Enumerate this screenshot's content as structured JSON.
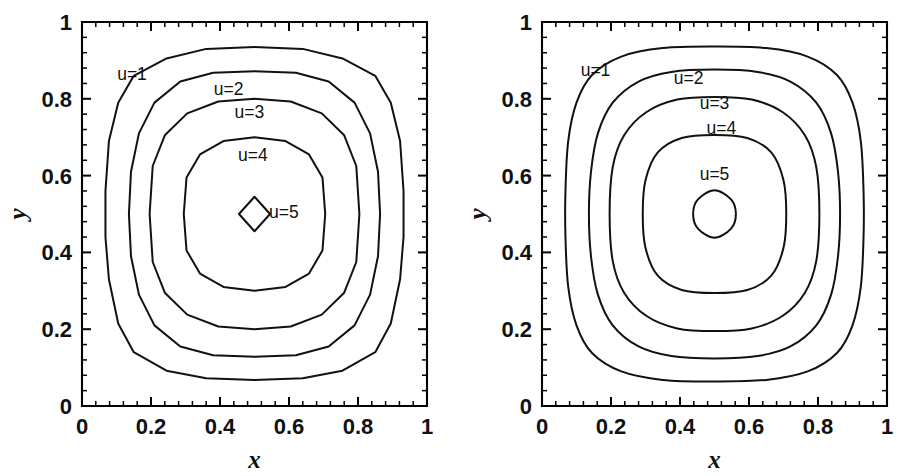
{
  "figure": {
    "background": "#ffffff",
    "line_color": "#111111",
    "panel_count": 2
  },
  "chart_data": [
    {
      "type": "line",
      "panel": "left",
      "title": "",
      "subtitle": "",
      "xlabel": "x",
      "ylabel": "y",
      "xlim": [
        0,
        1
      ],
      "ylim": [
        0,
        1
      ],
      "grid": false,
      "legend": "none",
      "xticks": [
        0,
        0.2,
        0.4,
        0.6,
        0.8,
        1
      ],
      "xticklabels": [
        "0",
        "0.2",
        "0.4",
        "0.6",
        "0.8",
        "1"
      ],
      "yticks": [
        0,
        0.2,
        0.4,
        0.6,
        0.8,
        1
      ],
      "yticklabels": [
        "0",
        "0.2",
        "0.4",
        "0.6",
        "0.8",
        "1"
      ],
      "minor_ticks_per_major": 4,
      "style": "polygonal-coarse-mesh",
      "contour_levels": [
        1,
        2,
        3,
        4,
        5
      ],
      "contour_labels": [
        "u=1",
        "u=2",
        "u=3",
        "u=4",
        "u=5"
      ],
      "label_positions": [
        {
          "label": "u=1",
          "x": 0.145,
          "y": 0.865
        },
        {
          "label": "u=2",
          "x": 0.425,
          "y": 0.825
        },
        {
          "label": "u=3",
          "x": 0.485,
          "y": 0.765
        },
        {
          "label": "u=4",
          "x": 0.495,
          "y": 0.655
        },
        {
          "label": "u=5",
          "x": 0.585,
          "y": 0.505
        }
      ],
      "center": {
        "x": 0.5,
        "y": 0.5
      },
      "contours": [
        {
          "level": 1,
          "points": [
            [
              0.5,
              0.935
            ],
            [
              0.36,
              0.93
            ],
            [
              0.245,
              0.905
            ],
            [
              0.15,
              0.86
            ],
            [
              0.105,
              0.79
            ],
            [
              0.078,
              0.69
            ],
            [
              0.068,
              0.56
            ],
            [
              0.068,
              0.44
            ],
            [
              0.078,
              0.33
            ],
            [
              0.105,
              0.215
            ],
            [
              0.15,
              0.14
            ],
            [
              0.245,
              0.092
            ],
            [
              0.36,
              0.072
            ],
            [
              0.5,
              0.068
            ],
            [
              0.64,
              0.072
            ],
            [
              0.755,
              0.092
            ],
            [
              0.85,
              0.14
            ],
            [
              0.895,
              0.215
            ],
            [
              0.922,
              0.33
            ],
            [
              0.932,
              0.44
            ],
            [
              0.932,
              0.56
            ],
            [
              0.922,
              0.69
            ],
            [
              0.895,
              0.79
            ],
            [
              0.85,
              0.86
            ],
            [
              0.755,
              0.905
            ],
            [
              0.64,
              0.93
            ]
          ]
        },
        {
          "level": 2,
          "points": [
            [
              0.5,
              0.872
            ],
            [
              0.38,
              0.868
            ],
            [
              0.285,
              0.845
            ],
            [
              0.21,
              0.79
            ],
            [
              0.165,
              0.71
            ],
            [
              0.142,
              0.61
            ],
            [
              0.136,
              0.5
            ],
            [
              0.142,
              0.39
            ],
            [
              0.165,
              0.29
            ],
            [
              0.21,
              0.21
            ],
            [
              0.285,
              0.155
            ],
            [
              0.38,
              0.132
            ],
            [
              0.5,
              0.128
            ],
            [
              0.62,
              0.132
            ],
            [
              0.715,
              0.155
            ],
            [
              0.79,
              0.21
            ],
            [
              0.835,
              0.29
            ],
            [
              0.858,
              0.39
            ],
            [
              0.864,
              0.5
            ],
            [
              0.858,
              0.61
            ],
            [
              0.835,
              0.71
            ],
            [
              0.79,
              0.79
            ],
            [
              0.715,
              0.845
            ],
            [
              0.62,
              0.868
            ]
          ]
        },
        {
          "level": 3,
          "points": [
            [
              0.5,
              0.8
            ],
            [
              0.395,
              0.793
            ],
            [
              0.305,
              0.762
            ],
            [
              0.24,
              0.705
            ],
            [
              0.205,
              0.625
            ],
            [
              0.196,
              0.5
            ],
            [
              0.205,
              0.375
            ],
            [
              0.24,
              0.295
            ],
            [
              0.305,
              0.238
            ],
            [
              0.395,
              0.207
            ],
            [
              0.5,
              0.2
            ],
            [
              0.605,
              0.207
            ],
            [
              0.695,
              0.238
            ],
            [
              0.76,
              0.295
            ],
            [
              0.795,
              0.375
            ],
            [
              0.804,
              0.5
            ],
            [
              0.795,
              0.625
            ],
            [
              0.76,
              0.705
            ],
            [
              0.695,
              0.762
            ],
            [
              0.605,
              0.793
            ]
          ]
        },
        {
          "level": 4,
          "points": [
            [
              0.5,
              0.7
            ],
            [
              0.41,
              0.69
            ],
            [
              0.342,
              0.655
            ],
            [
              0.303,
              0.595
            ],
            [
              0.295,
              0.5
            ],
            [
              0.303,
              0.405
            ],
            [
              0.342,
              0.345
            ],
            [
              0.41,
              0.31
            ],
            [
              0.5,
              0.3
            ],
            [
              0.59,
              0.31
            ],
            [
              0.658,
              0.345
            ],
            [
              0.697,
              0.405
            ],
            [
              0.705,
              0.5
            ],
            [
              0.697,
              0.595
            ],
            [
              0.658,
              0.655
            ],
            [
              0.59,
              0.69
            ]
          ]
        },
        {
          "level": 5,
          "points": [
            [
              0.5,
              0.545
            ],
            [
              0.455,
              0.5
            ],
            [
              0.5,
              0.455
            ],
            [
              0.545,
              0.5
            ]
          ]
        }
      ]
    },
    {
      "type": "line",
      "panel": "right",
      "title": "",
      "subtitle": "",
      "xlabel": "x",
      "ylabel": "y",
      "xlim": [
        0,
        1
      ],
      "ylim": [
        0,
        1
      ],
      "grid": false,
      "legend": "none",
      "xticks": [
        0,
        0.2,
        0.4,
        0.6,
        0.8,
        1
      ],
      "xticklabels": [
        "0",
        "0.2",
        "0.4",
        "0.6",
        "0.8",
        "1"
      ],
      "yticks": [
        0,
        0.2,
        0.4,
        0.6,
        0.8,
        1
      ],
      "yticklabels": [
        "0",
        "0.2",
        "0.4",
        "0.6",
        "0.8",
        "1"
      ],
      "minor_ticks_per_major": 4,
      "style": "smooth-fine-mesh",
      "contour_levels": [
        1,
        2,
        3,
        4,
        5
      ],
      "contour_labels": [
        "u=1",
        "u=2",
        "u=3",
        "u=4",
        "u=5"
      ],
      "label_positions": [
        {
          "label": "u=1",
          "x": 0.155,
          "y": 0.875
        },
        {
          "label": "u=2",
          "x": 0.425,
          "y": 0.855
        },
        {
          "label": "u=3",
          "x": 0.5,
          "y": 0.79
        },
        {
          "label": "u=4",
          "x": 0.52,
          "y": 0.725
        },
        {
          "label": "u=5",
          "x": 0.5,
          "y": 0.605
        }
      ],
      "center": {
        "x": 0.5,
        "y": 0.5
      },
      "contours": [
        {
          "level": 1,
          "points": [
            [
              0.5,
              0.936
            ],
            [
              0.35,
              0.932
            ],
            [
              0.23,
              0.91
            ],
            [
              0.145,
              0.862
            ],
            [
              0.1,
              0.79
            ],
            [
              0.076,
              0.69
            ],
            [
              0.068,
              0.56
            ],
            [
              0.068,
              0.44
            ],
            [
              0.076,
              0.31
            ],
            [
              0.1,
              0.21
            ],
            [
              0.145,
              0.138
            ],
            [
              0.23,
              0.09
            ],
            [
              0.35,
              0.068
            ],
            [
              0.5,
              0.064
            ],
            [
              0.65,
              0.068
            ],
            [
              0.77,
              0.09
            ],
            [
              0.855,
              0.138
            ],
            [
              0.9,
              0.21
            ],
            [
              0.924,
              0.31
            ],
            [
              0.932,
              0.44
            ],
            [
              0.932,
              0.56
            ],
            [
              0.924,
              0.69
            ],
            [
              0.9,
              0.79
            ],
            [
              0.855,
              0.862
            ],
            [
              0.77,
              0.91
            ],
            [
              0.65,
              0.932
            ]
          ]
        },
        {
          "level": 2,
          "points": [
            [
              0.5,
              0.876
            ],
            [
              0.375,
              0.87
            ],
            [
              0.28,
              0.845
            ],
            [
              0.205,
              0.79
            ],
            [
              0.162,
              0.71
            ],
            [
              0.142,
              0.61
            ],
            [
              0.136,
              0.5
            ],
            [
              0.142,
              0.39
            ],
            [
              0.162,
              0.29
            ],
            [
              0.205,
              0.21
            ],
            [
              0.28,
              0.155
            ],
            [
              0.375,
              0.13
            ],
            [
              0.5,
              0.124
            ],
            [
              0.625,
              0.13
            ],
            [
              0.72,
              0.155
            ],
            [
              0.795,
              0.21
            ],
            [
              0.838,
              0.29
            ],
            [
              0.858,
              0.39
            ],
            [
              0.864,
              0.5
            ],
            [
              0.858,
              0.61
            ],
            [
              0.838,
              0.71
            ],
            [
              0.795,
              0.79
            ],
            [
              0.72,
              0.845
            ],
            [
              0.625,
              0.87
            ]
          ]
        },
        {
          "level": 3,
          "points": [
            [
              0.5,
              0.805
            ],
            [
              0.392,
              0.798
            ],
            [
              0.302,
              0.765
            ],
            [
              0.238,
              0.705
            ],
            [
              0.205,
              0.622
            ],
            [
              0.196,
              0.5
            ],
            [
              0.205,
              0.378
            ],
            [
              0.238,
              0.295
            ],
            [
              0.302,
              0.235
            ],
            [
              0.392,
              0.202
            ],
            [
              0.5,
              0.195
            ],
            [
              0.608,
              0.202
            ],
            [
              0.698,
              0.235
            ],
            [
              0.762,
              0.295
            ],
            [
              0.795,
              0.378
            ],
            [
              0.804,
              0.5
            ],
            [
              0.795,
              0.622
            ],
            [
              0.762,
              0.705
            ],
            [
              0.698,
              0.765
            ],
            [
              0.608,
              0.798
            ]
          ]
        },
        {
          "level": 4,
          "points": [
            [
              0.5,
              0.706
            ],
            [
              0.405,
              0.698
            ],
            [
              0.335,
              0.66
            ],
            [
              0.3,
              0.588
            ],
            [
              0.292,
              0.5
            ],
            [
              0.3,
              0.412
            ],
            [
              0.335,
              0.34
            ],
            [
              0.405,
              0.302
            ],
            [
              0.5,
              0.294
            ],
            [
              0.595,
              0.302
            ],
            [
              0.665,
              0.34
            ],
            [
              0.7,
              0.412
            ],
            [
              0.708,
              0.5
            ],
            [
              0.7,
              0.588
            ],
            [
              0.665,
              0.66
            ],
            [
              0.595,
              0.698
            ]
          ]
        },
        {
          "level": 5,
          "points": [
            [
              0.5,
              0.562
            ],
            [
              0.452,
              0.538
            ],
            [
              0.438,
              0.5
            ],
            [
              0.452,
              0.462
            ],
            [
              0.5,
              0.438
            ],
            [
              0.548,
              0.462
            ],
            [
              0.562,
              0.5
            ],
            [
              0.548,
              0.538
            ]
          ]
        }
      ]
    }
  ]
}
